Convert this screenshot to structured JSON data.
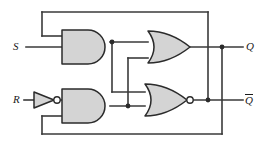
{
  "diagram": {
    "type": "logic-circuit-schematic",
    "colors": {
      "wire": "#3a3a3a",
      "gate_fill": "#d4d4d4",
      "gate_stroke": "#2b2b2b",
      "background": "#ffffff",
      "label": "#1a1a1a"
    },
    "inputs": [
      {
        "id": "S",
        "label": "S",
        "x": 16,
        "y": 47
      },
      {
        "id": "R",
        "label": "R",
        "x": 16,
        "y": 100
      }
    ],
    "outputs": [
      {
        "id": "Q",
        "label": "Q",
        "overbar": false,
        "x": 249,
        "y": 47
      },
      {
        "id": "Qbar",
        "label": "Q",
        "overbar": true,
        "x": 249,
        "y": 100
      }
    ],
    "gates": [
      {
        "id": "and-top",
        "name": "and-gate-top",
        "type": "AND",
        "inputs": [
          "feedback-from-qbar",
          "S"
        ],
        "output": "and-top-out",
        "x": 62,
        "y": 30,
        "w": 48,
        "h": 34
      },
      {
        "id": "inv-r",
        "name": "inverter-r",
        "type": "NOT",
        "inputs": [
          "R"
        ],
        "output": "r-inverted",
        "x": 34,
        "y": 92,
        "w": 22,
        "h": 16
      },
      {
        "id": "and-bottom",
        "name": "and-gate-bottom",
        "type": "AND",
        "inputs": [
          "r-inverted",
          "feedback-from-q"
        ],
        "output": "and-bottom-out",
        "x": 62,
        "y": 89,
        "w": 48,
        "h": 34
      },
      {
        "id": "or-top",
        "name": "or-gate-top",
        "type": "OR",
        "inputs": [
          "and-top-out",
          "and-bottom-out"
        ],
        "output": "Q",
        "x": 148,
        "y": 34,
        "w": 42,
        "h": 32
      },
      {
        "id": "nor-bottom",
        "name": "nor-gate-bottom",
        "type": "NOR",
        "inputs": [
          "and-top-out",
          "and-bottom-out"
        ],
        "output": "Qbar",
        "x": 145,
        "y": 84,
        "w": 42,
        "h": 32,
        "bubble": true
      }
    ],
    "junctions": [
      {
        "id": "j-and-top-out",
        "x": 112,
        "y": 42
      },
      {
        "id": "j-and-bottom-out",
        "x": 128,
        "y": 106
      },
      {
        "id": "j-q-line",
        "x": 222,
        "y": 47
      },
      {
        "id": "j-qbar-line",
        "x": 208,
        "y": 100
      }
    ],
    "feedback": [
      {
        "id": "qbar-to-and-top",
        "from": "Qbar",
        "to": "and-gate-top",
        "path": "up-over-top"
      },
      {
        "id": "q-to-and-bottom",
        "from": "Q",
        "to": "and-gate-bottom",
        "path": "down-under-bottom"
      }
    ]
  }
}
